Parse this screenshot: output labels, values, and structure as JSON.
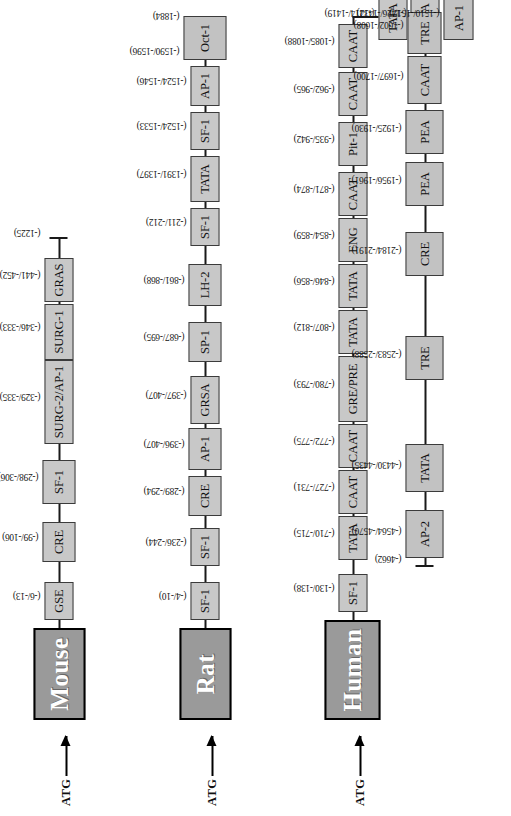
{
  "figure": {
    "atg_label": "ATG",
    "colors": {
      "species_box_fill": "#9a9a9a",
      "species_box_text": "#ffffff",
      "species_box_border": "#000000",
      "tf_box_fill": "#c8c8c8",
      "tf_box_border": "#3b3b3b",
      "line": "#1a1a1a",
      "background": "#ffffff"
    }
  },
  "lanes": [
    {
      "id": "mouse",
      "species": "Mouse",
      "atg_label": "ATG",
      "end_coord": "(-1225)",
      "sites": [
        {
          "label": "GSE",
          "coord": "(-6/-13)"
        },
        {
          "label": "CRE",
          "coord": "(-99/-106)"
        },
        {
          "label": "SF-1",
          "coord": "(-298/-306)"
        },
        {
          "label": "SURG-2/AP-1",
          "coord": "(-329/-335)"
        },
        {
          "label": "SURG-1",
          "coord": "(-346/-333)"
        },
        {
          "label": "GRAS",
          "coord": "(-441/-452)"
        }
      ]
    },
    {
      "id": "rat",
      "species": "Rat",
      "atg_label": "ATG",
      "end_coord": "(-1884)",
      "sites": [
        {
          "label": "SF-1",
          "coord": "(-4/-10)"
        },
        {
          "label": "SF-1",
          "coord": "(-236/-244)"
        },
        {
          "label": "CRE",
          "coord": "(-289/-294)"
        },
        {
          "label": "AP-1",
          "coord": "(-396/-407)"
        },
        {
          "label": "GRSA",
          "coord": "(-397/-407)"
        },
        {
          "label": "SP-1",
          "coord": "(-687/-695)"
        },
        {
          "label": "LH-2",
          "coord": "(-861/-868)"
        },
        {
          "label": "SF-1",
          "coord": "(-211/-212)"
        },
        {
          "label": "TATA",
          "coord": "(-1391/-1397)"
        },
        {
          "label": "SF-1",
          "coord": "(-1524/-1533)"
        },
        {
          "label": "AP-1",
          "coord": "(-1524/-1546)"
        },
        {
          "label": "Oct-1",
          "coord": "(-1590/-1596)"
        }
      ]
    },
    {
      "id": "human",
      "species": "Human",
      "atg_label": "ATG",
      "end_coord": "(-4662)",
      "sites_line1": [
        {
          "label": "SF-1",
          "coord": "(-130/-138)"
        },
        {
          "label": "TATA",
          "coord": "(-710/-715)"
        },
        {
          "label": "CAAT",
          "coord": "(-727/-731)"
        },
        {
          "label": "CAAT",
          "coord": "(-772/-775)"
        },
        {
          "label": "GRE/PRE",
          "coord": "(-780/-793)"
        },
        {
          "label": "TATA",
          "coord": "(-807/-812)"
        },
        {
          "label": "TATA",
          "coord": "(-846/-856)"
        },
        {
          "label": "ENG",
          "coord": "(-854/-859)"
        },
        {
          "label": "CAAT",
          "coord": "(-871/-874)"
        },
        {
          "label": "Pit-1",
          "coord": "(-935/-942)"
        },
        {
          "label": "CAAT",
          "coord": "(-962/-965)"
        },
        {
          "label": "CAAT",
          "coord": "(-1085/-1088)"
        },
        {
          "label": "TATA",
          "coord": "(-1414/-1419)"
        },
        {
          "label": "TATA",
          "coord": "(-1426/-1432)"
        }
      ],
      "sites_line2": [
        {
          "label": "AP-2",
          "coord": "(-4564/-4570)"
        },
        {
          "label": "TATA",
          "coord": "(-4430/-4435)"
        },
        {
          "label": "TRE",
          "coord": "(-2583/-2588)"
        },
        {
          "label": "CRE",
          "coord": "(-2184/-2191)"
        },
        {
          "label": "PEA",
          "coord": "(-1956/-1961)"
        },
        {
          "label": "PEA",
          "coord": "(-1925/-1930)"
        },
        {
          "label": "CAAT",
          "coord": "(-1697/-1700)"
        },
        {
          "label": "TRE",
          "coord": "(-1602/-1608)"
        },
        {
          "label": "AP-1",
          "coord": "(-1510/-1517)"
        }
      ]
    }
  ]
}
